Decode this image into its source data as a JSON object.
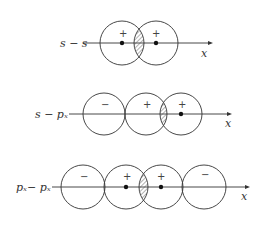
{
  "diagrams": [
    {
      "label": "s − s",
      "axis_label": "x",
      "lobes": [
        {
          "sign": "+",
          "nucleus": true
        },
        {
          "sign": "+",
          "nucleus": true
        }
      ],
      "overlap": "hatched"
    },
    {
      "label": "s − pₓ",
      "axis_label": "x",
      "lobes": [
        {
          "sign": "−",
          "nucleus": false
        },
        {
          "sign": "+",
          "nucleus": false
        },
        {
          "sign": "+",
          "nucleus": true
        }
      ],
      "overlap": "hatched"
    },
    {
      "label": "pₓ− pₓ",
      "axis_label": "x",
      "lobes": [
        {
          "sign": "−",
          "nucleus": false
        },
        {
          "sign": "+",
          "nucleus": true
        },
        {
          "sign": "+",
          "nucleus": true
        },
        {
          "sign": "−",
          "nucleus": false
        }
      ],
      "overlap": "hatched"
    }
  ]
}
